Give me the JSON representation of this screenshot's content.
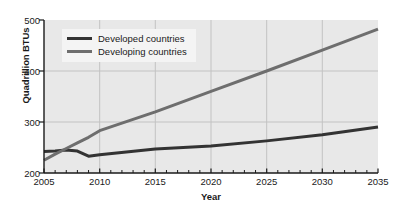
{
  "chart_data": {
    "type": "line",
    "title": "",
    "xlabel": "Year",
    "ylabel": "Quadrillion BTUs",
    "xlim": [
      2005,
      2035
    ],
    "ylim": [
      200,
      500
    ],
    "xticks": [
      "2005",
      "2010",
      "2015",
      "2020",
      "2025",
      "2030",
      "2035"
    ],
    "yticks": [
      "200",
      "300",
      "400",
      "500"
    ],
    "x_minor_tick_interval": 1,
    "grid": "major-xy",
    "legend_position": "upper-left-inside",
    "x": [
      2005,
      2006,
      2007,
      2008,
      2009,
      2010,
      2015,
      2020,
      2025,
      2030,
      2035
    ],
    "series": [
      {
        "name": "Developed countries",
        "color": "#333333",
        "values": [
          242,
          243,
          245,
          243,
          233,
          236,
          247,
          253,
          263,
          275,
          290
        ]
      },
      {
        "name": "Developing countries",
        "color": "#6e6e6e",
        "values": [
          225,
          237,
          248,
          259,
          270,
          283,
          320,
          360,
          400,
          441,
          482
        ]
      }
    ],
    "annotations": []
  },
  "legend": {
    "items": [
      {
        "label": "Developed countries",
        "color": "#333333"
      },
      {
        "label": "Developing countries",
        "color": "#6e6e6e"
      }
    ]
  },
  "axes": {
    "x_title": "Year",
    "y_title": "Quadrillion BTUs",
    "x_tick_labels": [
      "2005",
      "2010",
      "2015",
      "2020",
      "2025",
      "2030",
      "2035"
    ],
    "y_tick_labels": [
      "500",
      "400",
      "300",
      "200"
    ]
  },
  "colors": {
    "plot_background": "#e8e8e8",
    "figure_background": "#ffffff",
    "grid": "#c2c2c2",
    "axis": "#1a1a1a",
    "legend_background": "#f4f4f4",
    "developed": "#333333",
    "developing": "#6e6e6e"
  }
}
